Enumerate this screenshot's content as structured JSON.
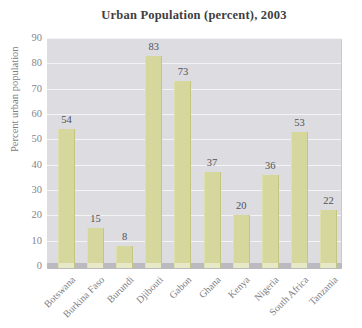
{
  "chart_data": {
    "type": "bar",
    "title": "Urban Population (percent), 2003",
    "ylabel": "Percent urban population",
    "xlabel": "",
    "categories": [
      "Botswana",
      "Burkina Faso",
      "Burundi",
      "Djibouti",
      "Gabon",
      "Ghana",
      "Kenya",
      "Nigeria",
      "South Africa",
      "Tanzania"
    ],
    "values": [
      54,
      15,
      8,
      83,
      73,
      37,
      20,
      36,
      53,
      22
    ],
    "ylim": [
      0,
      90
    ],
    "ytick_step": 10,
    "yticks": [
      0,
      10,
      20,
      30,
      40,
      50,
      60,
      70,
      80,
      90
    ],
    "grid": "horizontal-white",
    "legend": "none",
    "data_labels": true,
    "colors": {
      "bar_fill": "#d5d79c",
      "bar_foot": "#e7e8c6",
      "plot_background": "#dcdce1",
      "gridline": "#f4f4f7",
      "baseline_strip": "#babac0",
      "title_text": "#3e3e40",
      "tick_text": "#85858c",
      "category_text": "#7d7d84",
      "value_text": "#515156"
    }
  }
}
